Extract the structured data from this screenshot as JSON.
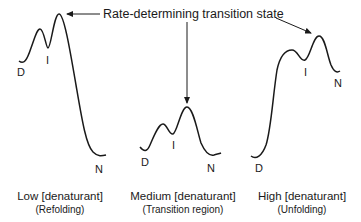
{
  "diagram": {
    "title": "Rate-determining transition state",
    "panels": [
      {
        "condition": "Low [denaturant]",
        "regime": "(Refolding)",
        "states": {
          "d": "D",
          "i": "I",
          "n": "N"
        }
      },
      {
        "condition": "Medium [denaturant]",
        "regime": "(Transition region)",
        "states": {
          "d": "D",
          "i": "I",
          "n": "N"
        }
      },
      {
        "condition": "High [denaturant]",
        "regime": "(Unfolding)",
        "states": {
          "d": "D",
          "i": "I",
          "n": "N"
        }
      }
    ],
    "colors": {
      "line": "#1a1a1a",
      "background": "#ffffff"
    }
  }
}
